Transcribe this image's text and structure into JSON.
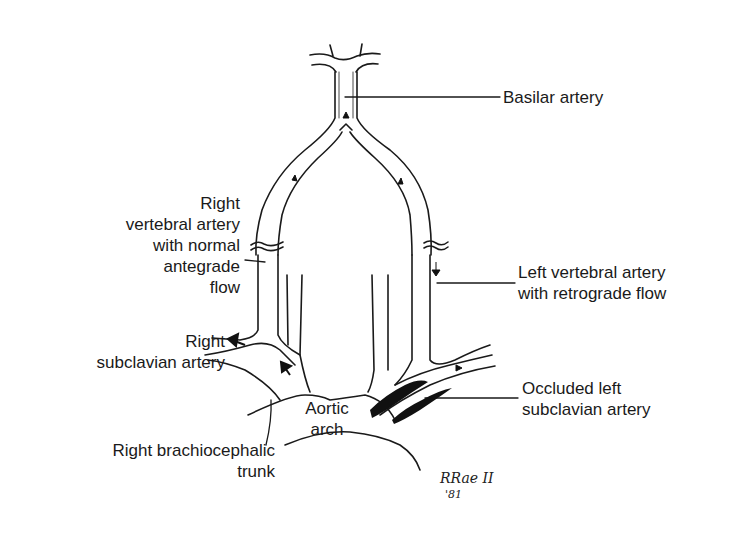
{
  "diagram": {
    "type": "anatomical illustration",
    "stroke_color": "#1a1a1a",
    "background": "#ffffff"
  },
  "labels": {
    "basilar": "Basilar artery",
    "right_vertebral": "Right\nvertebral artery\nwith normal\nantegrade\nflow",
    "left_vertebral": "Left vertebral artery\nwith retrograde flow",
    "right_subclavian": "Right\nsubclavian artery",
    "occluded_left_subclavian": "Occluded left\nsubclavian artery",
    "aortic_arch": "Aortic\narch",
    "brachiocephalic": "Right brachiocephalic\ntrunk"
  },
  "signature": {
    "name": "RRae II",
    "year": "'81"
  }
}
